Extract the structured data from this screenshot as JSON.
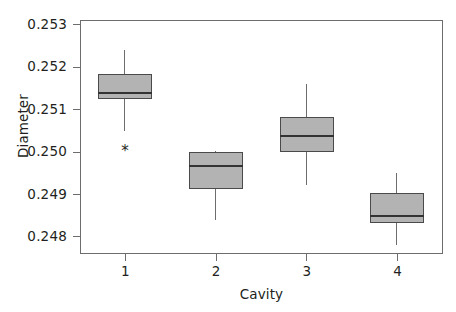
{
  "chart_data": {
    "type": "box",
    "title": "",
    "xlabel": "Cavity",
    "ylabel": "Diameter",
    "categories": [
      "1",
      "2",
      "3",
      "4"
    ],
    "ylim": [
      0.2476,
      0.25312
    ],
    "yticks": [
      0.253,
      0.252,
      0.251,
      0.25,
      0.249,
      0.248
    ],
    "ytick_labels": [
      "0.253",
      "0.252",
      "0.251",
      "0.250",
      "0.249",
      "0.248"
    ],
    "xtick_labels": [
      "1",
      "2",
      "3",
      "4"
    ],
    "grid": false,
    "legend": "none",
    "boxes": [
      {
        "category": "1",
        "whisker_low": 0.2505,
        "q1": 0.25125,
        "median": 0.25138,
        "q3": 0.25185,
        "whisker_high": 0.2524,
        "outliers": [
          0.25008
        ]
      },
      {
        "category": "2",
        "whisker_low": 0.2484,
        "q1": 0.24912,
        "median": 0.24966,
        "q3": 0.25,
        "whisker_high": 0.25003,
        "outliers": []
      },
      {
        "category": "3",
        "whisker_low": 0.24922,
        "q1": 0.25,
        "median": 0.25038,
        "q3": 0.25082,
        "whisker_high": 0.2516,
        "outliers": []
      },
      {
        "category": "4",
        "whisker_low": 0.2478,
        "q1": 0.24832,
        "median": 0.2485,
        "q3": 0.24903,
        "whisker_high": 0.2495,
        "outliers": []
      }
    ],
    "colors": {
      "box_fill": "#b3b3b3",
      "box_edge": "#4a4a4a",
      "median": "#333333",
      "whisker": "#6d6d6d",
      "frame": "#6d6d6d",
      "text": "#231f20",
      "background": "#ffffff"
    },
    "outlier_marker": "*"
  },
  "geometry": {
    "plot_left": 80,
    "plot_top": 20,
    "plot_width": 363,
    "plot_height": 234,
    "box_width": 54
  }
}
